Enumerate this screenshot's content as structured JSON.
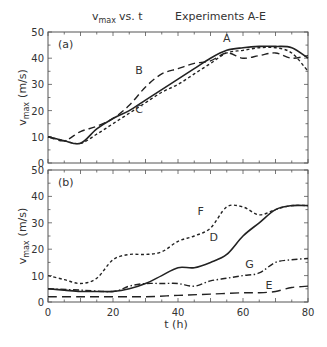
{
  "chart_data": [
    {
      "type": "line",
      "panel": "(a)",
      "title": "v_max vs. t        Experiments A-E",
      "xlabel": "t (h)",
      "ylabel": "v_max (m/s)",
      "xlim": [
        0,
        80
      ],
      "ylim": [
        0,
        50
      ],
      "xticks": [
        0,
        20,
        40,
        60,
        80
      ],
      "yticks": [
        0,
        10,
        20,
        30,
        40,
        50
      ],
      "grid": false,
      "series": [
        {
          "name": "A",
          "style": "solid",
          "x": [
            0,
            5,
            10,
            15,
            20,
            25,
            30,
            35,
            40,
            45,
            50,
            55,
            60,
            65,
            70,
            75,
            80
          ],
          "y": [
            10,
            8.5,
            7.5,
            13,
            17,
            20,
            24,
            28,
            32,
            36,
            40,
            43,
            44,
            44.5,
            44.5,
            44,
            40
          ]
        },
        {
          "name": "B",
          "style": "dash",
          "x": [
            0,
            5,
            10,
            15,
            20,
            25,
            30,
            35,
            40,
            45,
            50,
            55,
            60,
            65,
            70,
            75,
            80
          ],
          "y": [
            10,
            8.5,
            12,
            14,
            17,
            22,
            29,
            34,
            36,
            38,
            39,
            42,
            40,
            41,
            42,
            40,
            41
          ]
        },
        {
          "name": "C",
          "style": "short-dash",
          "x": [
            0,
            5,
            10,
            15,
            20,
            25,
            30,
            35,
            40,
            45,
            50,
            55,
            60,
            65,
            70,
            75,
            80
          ],
          "y": [
            10,
            8.5,
            7.5,
            11,
            15,
            19,
            23,
            27,
            30,
            34,
            38,
            42,
            43,
            44,
            44,
            42,
            35
          ]
        }
      ],
      "labels": [
        {
          "text": "A",
          "x": 55,
          "y": 46
        },
        {
          "text": "B",
          "x": 28,
          "y": 34
        },
        {
          "text": "C",
          "x": 28,
          "y": 19
        }
      ]
    },
    {
      "type": "line",
      "panel": "(b)",
      "xlabel": "t (h)",
      "ylabel": "v_max (m/s)",
      "xlim": [
        0,
        80
      ],
      "ylim": [
        0,
        50
      ],
      "xticks": [
        0,
        20,
        40,
        60,
        80
      ],
      "yticks": [
        0,
        10,
        20,
        30,
        40,
        50
      ],
      "grid": false,
      "series": [
        {
          "name": "D",
          "style": "solid",
          "x": [
            0,
            5,
            10,
            15,
            20,
            25,
            30,
            35,
            40,
            45,
            50,
            55,
            60,
            65,
            70,
            75,
            80
          ],
          "y": [
            5,
            4.5,
            4,
            4,
            4,
            5,
            7,
            10,
            13,
            13,
            15,
            18,
            25,
            30,
            35,
            36.5,
            36.5
          ]
        },
        {
          "name": "E",
          "style": "long-dash",
          "x": [
            0,
            10,
            20,
            30,
            40,
            50,
            60,
            65,
            70,
            75,
            80
          ],
          "y": [
            2,
            2,
            2,
            2,
            2.5,
            3,
            3.5,
            3.5,
            4,
            5.5,
            6
          ]
        },
        {
          "name": "F",
          "style": "short-dash",
          "x": [
            0,
            5,
            10,
            15,
            20,
            25,
            30,
            35,
            40,
            45,
            50,
            55,
            60,
            65,
            70,
            75,
            80
          ],
          "y": [
            10,
            8.5,
            7,
            9,
            16,
            18,
            18,
            19,
            23,
            25,
            28,
            36,
            36,
            33,
            35,
            36.5,
            36.5
          ]
        },
        {
          "name": "G",
          "style": "dash-dot",
          "x": [
            0,
            10,
            20,
            25,
            30,
            35,
            40,
            45,
            50,
            55,
            60,
            65,
            70,
            75,
            80
          ],
          "y": [
            5,
            4.5,
            4,
            6,
            7,
            7,
            7,
            6,
            8,
            9,
            10,
            11,
            15,
            16,
            16.5
          ]
        }
      ],
      "labels": [
        {
          "text": "F",
          "x": 47,
          "y": 33
        },
        {
          "text": "D",
          "x": 51,
          "y": 23
        },
        {
          "text": "G",
          "x": 62,
          "y": 13
        },
        {
          "text": "E",
          "x": 68,
          "y": 5
        }
      ]
    }
  ],
  "title": {
    "left": "v",
    "left_sub": "max",
    "left_rest": "vs. t",
    "right": "Experiments A-E"
  },
  "panels": {
    "a_label": "(a)",
    "b_label": "(b)"
  },
  "axis": {
    "xlabel": "t (h)",
    "ylabel_main": "v",
    "ylabel_sub": "max",
    "ylabel_unit": "(m/s)"
  }
}
